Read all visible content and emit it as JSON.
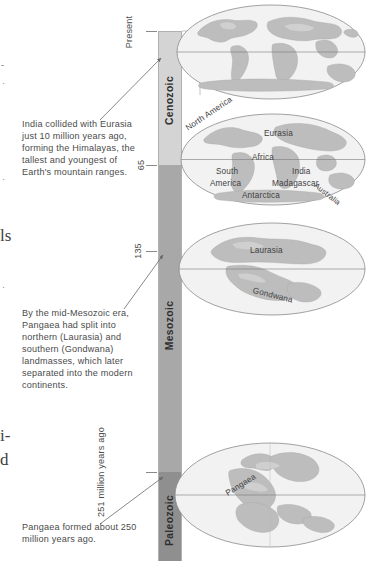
{
  "figure": {
    "axis_unit_label": "million years ago"
  },
  "page_bleed": {
    "fragments": [
      {
        "text": "-",
        "top": 62
      },
      {
        "text": "·",
        "top": 80
      },
      {
        "text": "·",
        "top": 176
      },
      {
        "text": "ls",
        "top": 232
      },
      {
        "text": "·",
        "top": 284
      },
      {
        "text": "i-",
        "top": 432
      },
      {
        "text": "d",
        "top": 456
      }
    ]
  },
  "timeline": {
    "eras": [
      {
        "name": "Cenozoic",
        "color": "#d4d4d4"
      },
      {
        "name": "Mesozoic",
        "color": "#a8a8a8"
      },
      {
        "name": "Paleozoic",
        "color": "#8f8f8f"
      }
    ],
    "ticks": [
      {
        "label": "Present",
        "value": 0
      },
      {
        "label": "65",
        "value": 65
      },
      {
        "label": "135",
        "value": 135
      },
      {
        "label": "251 million years ago",
        "value": 251
      }
    ]
  },
  "captions": [
    {
      "id": "india",
      "text": "India collided with Eurasia just 10 million years ago, forming the Himalayas, the tallest and youngest of Earth's mountain ranges."
    },
    {
      "id": "mesozoic",
      "text": "By the mid-Mesozoic era, Pangaea had split into northern (Laurasia) and southern (Gondwana) landmasses, which later separated into the modern continents."
    },
    {
      "id": "pangaea",
      "text": "Pangaea formed about 250 million years ago."
    }
  ],
  "globes": [
    {
      "id": "present",
      "era_label": "Present",
      "labels": []
    },
    {
      "id": "cenozoic-65",
      "era_label": "65",
      "labels": [
        "North America",
        "Eurasia",
        "Africa",
        "South America",
        "India",
        "Madagascar",
        "Australia",
        "Antarctica"
      ]
    },
    {
      "id": "mesozoic-135",
      "era_label": "135",
      "labels": [
        "Laurasia",
        "Gondwana"
      ]
    },
    {
      "id": "paleozoic-251",
      "era_label": "251",
      "labels": [
        "Pangaea"
      ]
    }
  ],
  "globe_labels": {
    "north_america": "North America",
    "eurasia": "Eurasia",
    "africa": "Africa",
    "south": "South",
    "america": "America",
    "india": "India",
    "madagascar": "Madagascar",
    "australia": "Australia",
    "antarctica": "Antarctica",
    "laurasia": "Laurasia",
    "gondwana": "Gondwana",
    "pangaea": "Pangaea"
  },
  "colors": {
    "ocean": "#f2f2f2",
    "land_light": "#c9c9c9",
    "land_mid": "#b4b4b4",
    "outline": "#8a8a8a",
    "bar_cenozoic": "#d4d4d4",
    "bar_mesozoic": "#a8a8a8",
    "bar_paleozoic": "#8f8f8f",
    "text": "#4b4b4b"
  }
}
